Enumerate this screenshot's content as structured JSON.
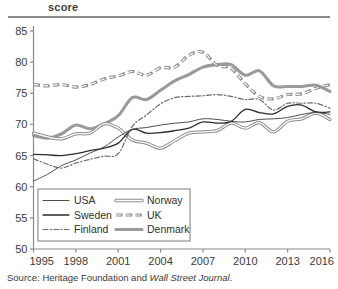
{
  "header": {
    "title": "score"
  },
  "source": {
    "prefix": "Source: Heritage Foundation and ",
    "italic": "Wall Street Journal",
    "suffix": "."
  },
  "colors": {
    "axis": "#8a8a8a",
    "rule": "#8a8a8a",
    "usa": "#4d4d4d",
    "sweden": "#2b2b2b",
    "finland": "#6b6b6b",
    "norway": "#8c8c8c",
    "uk": "#8c8c8c",
    "denmark": "#9a9a9a",
    "text": "#3a3a3a",
    "background": "#ffffff"
  },
  "chart_data": {
    "type": "line",
    "title": "score",
    "xlabel": "",
    "ylabel": "score",
    "xlim": [
      1995,
      2016
    ],
    "ylim": [
      50,
      85
    ],
    "yticks": [
      50,
      55,
      60,
      65,
      70,
      75,
      80,
      85
    ],
    "xticks": [
      1995,
      1998,
      2001,
      2004,
      2007,
      2010,
      2013,
      2016
    ],
    "grid": false,
    "legend_position": "bottom-left-inside",
    "x": [
      1995,
      1996,
      1997,
      1998,
      1999,
      2000,
      2001,
      2002,
      2003,
      2004,
      2005,
      2006,
      2007,
      2008,
      2009,
      2010,
      2011,
      2012,
      2013,
      2014,
      2015,
      2016
    ],
    "series": [
      {
        "name": "USA",
        "style": "solid-thin",
        "color": "#4d4d4d",
        "values": [
          60.9,
          62.0,
          63.4,
          64.3,
          65.4,
          66.4,
          68.0,
          69.2,
          69.5,
          69.9,
          70.2,
          70.4,
          70.9,
          70.8,
          70.5,
          70.4,
          70.8,
          70.9,
          71.1,
          71.6,
          71.9,
          71.6
        ]
      },
      {
        "name": "Sweden",
        "style": "solid-medium",
        "color": "#2b2b2b",
        "values": [
          65.2,
          65.1,
          65.0,
          65.3,
          65.8,
          66.2,
          67.0,
          69.2,
          68.6,
          68.7,
          69.0,
          69.4,
          70.4,
          70.2,
          70.5,
          72.4,
          71.9,
          71.7,
          72.9,
          73.1,
          72.0,
          72.0
        ]
      },
      {
        "name": "Finland",
        "style": "dash-dot",
        "color": "#6b6b6b",
        "values": [
          64.5,
          63.6,
          63.0,
          63.8,
          64.4,
          64.9,
          65.3,
          69.7,
          71.5,
          73.3,
          74.3,
          74.5,
          74.6,
          74.8,
          74.5,
          74.0,
          74.0,
          72.3,
          73.4,
          73.4,
          73.4,
          72.6
        ]
      },
      {
        "name": "Norway",
        "style": "double-line",
        "color": "#8c8c8c",
        "values": [
          68.6,
          68.0,
          67.7,
          68.5,
          68.6,
          70.1,
          69.4,
          67.5,
          67.0,
          66.2,
          67.4,
          68.6,
          68.8,
          69.0,
          70.2,
          69.4,
          70.3,
          68.8,
          70.5,
          70.9,
          71.8,
          70.8
        ]
      },
      {
        "name": "UK",
        "style": "dashed-thick",
        "color": "#8c8c8c",
        "values": [
          76.4,
          76.2,
          76.4,
          76.0,
          76.4,
          77.3,
          77.8,
          78.5,
          77.9,
          79.1,
          79.2,
          81.1,
          81.6,
          79.5,
          79.0,
          76.5,
          74.5,
          74.1,
          74.8,
          74.9,
          75.8,
          76.4
        ]
      },
      {
        "name": "Denmark",
        "style": "solid-thick",
        "color": "#9a9a9a",
        "values": [
          68.2,
          67.8,
          68.5,
          69.9,
          69.3,
          70.1,
          71.4,
          74.3,
          74.0,
          75.5,
          77.0,
          78.0,
          79.2,
          79.6,
          79.6,
          77.9,
          78.6,
          76.2,
          76.1,
          76.1,
          76.3,
          75.3
        ]
      }
    ],
    "legend_entries": [
      {
        "label": "USA",
        "style": "solid-thin",
        "color": "#4d4d4d"
      },
      {
        "label": "Norway",
        "style": "double-line",
        "color": "#8c8c8c"
      },
      {
        "label": "Sweden",
        "style": "solid-medium",
        "color": "#2b2b2b"
      },
      {
        "label": "UK",
        "style": "dashed-thick",
        "color": "#8c8c8c"
      },
      {
        "label": "Finland",
        "style": "dash-dot",
        "color": "#6b6b6b"
      },
      {
        "label": "Denmark",
        "style": "solid-thick",
        "color": "#9a9a9a"
      }
    ]
  }
}
